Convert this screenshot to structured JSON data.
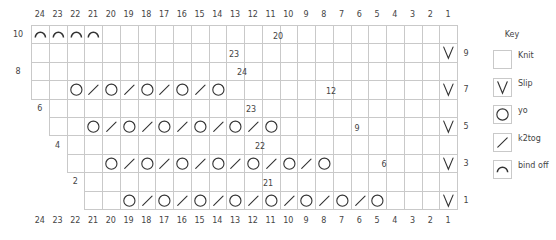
{
  "chart": {
    "columns": [
      24,
      23,
      22,
      21,
      20,
      19,
      18,
      17,
      16,
      15,
      14,
      13,
      12,
      11,
      10,
      9,
      8,
      7,
      6,
      5,
      4,
      3,
      2,
      1
    ],
    "rows": [
      {
        "row": 10,
        "start_col": 24,
        "label_side": "left",
        "stitches": {
          "24": "bind off",
          "23": "bind off",
          "22": "bind off",
          "21": "bind off"
        }
      },
      {
        "row": 9,
        "start_col": 24,
        "label_side": "right",
        "stitches": {
          "1": "slip"
        }
      },
      {
        "row": 8,
        "start_col": 24,
        "label_side": "left",
        "stitches": {}
      },
      {
        "row": 7,
        "start_col": 24,
        "label_side": "right",
        "stitches": {
          "22": "yo",
          "21": "k2tog",
          "20": "yo",
          "19": "k2tog",
          "18": "yo",
          "17": "k2tog",
          "16": "yo",
          "15": "k2tog",
          "14": "yo",
          "1": "slip"
        }
      },
      {
        "row": 6,
        "start_col": 23,
        "label_side": "left",
        "stitches": {}
      },
      {
        "row": 5,
        "start_col": 23,
        "label_side": "right",
        "stitches": {
          "21": "yo",
          "20": "k2tog",
          "19": "yo",
          "18": "k2tog",
          "17": "yo",
          "16": "k2tog",
          "15": "yo",
          "14": "k2tog",
          "13": "yo",
          "12": "k2tog",
          "11": "yo",
          "1": "slip"
        }
      },
      {
        "row": 4,
        "start_col": 22,
        "label_side": "left",
        "stitches": {}
      },
      {
        "row": 3,
        "start_col": 22,
        "label_side": "right",
        "stitches": {
          "20": "yo",
          "19": "k2tog",
          "18": "yo",
          "17": "k2tog",
          "16": "yo",
          "15": "k2tog",
          "14": "yo",
          "13": "k2tog",
          "12": "yo",
          "11": "k2tog",
          "10": "yo",
          "9": "k2tog",
          "8": "yo",
          "1": "slip"
        }
      },
      {
        "row": 2,
        "start_col": 21,
        "label_side": "left",
        "stitches": {}
      },
      {
        "row": 1,
        "start_col": 21,
        "label_side": "right",
        "stitches": {
          "19": "yo",
          "18": "k2tog",
          "17": "yo",
          "16": "k2tog",
          "15": "yo",
          "14": "k2tog",
          "13": "yo",
          "12": "k2tog",
          "11": "yo",
          "10": "k2tog",
          "9": "yo",
          "8": "k2tog",
          "7": "yo",
          "6": "k2tog",
          "5": "yo",
          "1": "slip"
        }
      }
    ],
    "annotations": [
      {
        "text": "20",
        "x": 278,
        "y": 36
      },
      {
        "text": "23",
        "x": 234,
        "y": 54
      },
      {
        "text": "24",
        "x": 242,
        "y": 72
      },
      {
        "text": "12",
        "x": 331,
        "y": 91
      },
      {
        "text": "23",
        "x": 251,
        "y": 109
      },
      {
        "text": "9",
        "x": 357,
        "y": 128
      },
      {
        "text": "22",
        "x": 260,
        "y": 146
      },
      {
        "text": "6",
        "x": 384,
        "y": 164
      },
      {
        "text": "21",
        "x": 268,
        "y": 183
      }
    ]
  },
  "key": {
    "title": "Key",
    "items": [
      {
        "symbol": "knit",
        "label": "Knit"
      },
      {
        "symbol": "slip",
        "label": "Slip"
      },
      {
        "symbol": "yo",
        "label": "yo"
      },
      {
        "symbol": "k2tog",
        "label": "k2tog"
      },
      {
        "symbol": "bind off",
        "label": "bind off"
      }
    ]
  },
  "colors": {
    "grid_line": "#c9c9c9",
    "symbol": "#333333",
    "text": "#444444"
  }
}
